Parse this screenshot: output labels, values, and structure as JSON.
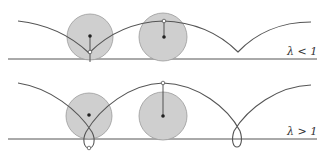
{
  "panels": [
    {
      "id": "top",
      "label": "λ < 1",
      "description": "curtate trochoid"
    },
    {
      "id": "bottom",
      "label": "λ > 1",
      "description": "prolate trochoid"
    }
  ],
  "colors": {
    "disk_fill": "#cfcfcf",
    "disk_stroke": "#9a9a9a",
    "curve": "#555555",
    "ground": "#555555"
  }
}
